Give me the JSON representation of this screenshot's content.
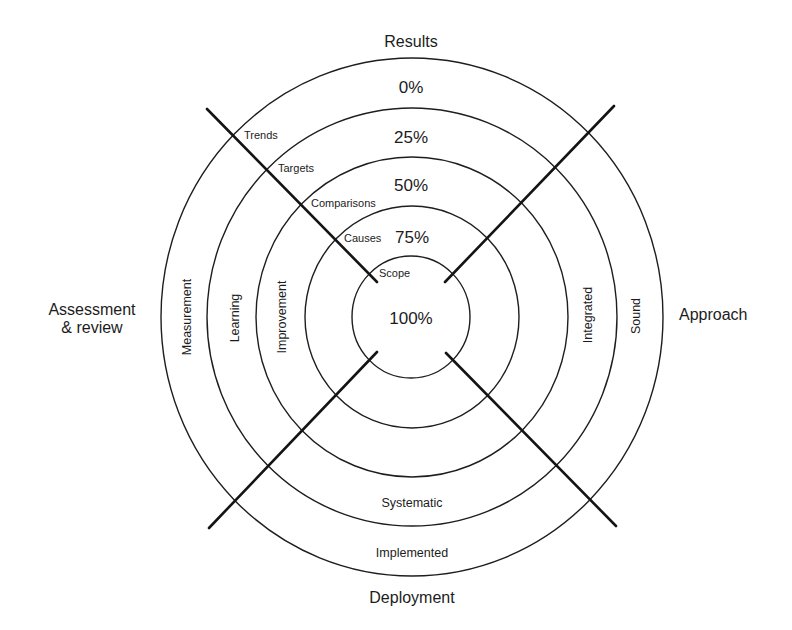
{
  "diagram": {
    "dimensions": {
      "top": "Results",
      "right": "Approach",
      "bottom": "Deployment",
      "left_line1": "Assessment",
      "left_line2": "& review"
    },
    "percentages": [
      "0%",
      "25%",
      "50%",
      "75%",
      "100%"
    ],
    "results_axis_labels": [
      "Trends",
      "Targets",
      "Comparisons",
      "Causes",
      "Scope"
    ],
    "assessment_ring_labels": [
      "Measurement",
      "Learning",
      "Improvement"
    ],
    "approach_ring_labels": [
      "Integrated",
      "Sound"
    ],
    "deployment_ring_labels": [
      "Systematic",
      "Implemented"
    ],
    "colors": {
      "line": "#1e1e1e",
      "text": "#1c1c1c",
      "background": "#ffffff"
    }
  }
}
